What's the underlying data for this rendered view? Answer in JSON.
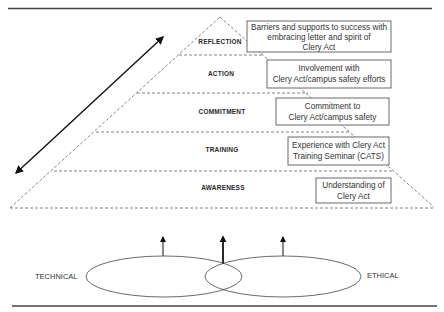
{
  "diagram": {
    "type": "pyramid-with-venn",
    "pyramid_layers": [
      {
        "label": "REFLECTION",
        "description": [
          "Barriers and supports to success with",
          "embracing letter and spirit of",
          "Clery Act"
        ]
      },
      {
        "label": "ACTION",
        "description": [
          "Involvement with",
          "Clery Act/campus safety efforts"
        ]
      },
      {
        "label": "COMMITMENT",
        "description": [
          "Commitment to",
          "Clery Act/campus safety"
        ]
      },
      {
        "label": "TRAINING",
        "description": [
          "Experience with Clery Act",
          "Training Seminar (CATS)"
        ]
      },
      {
        "label": "AWARENESS",
        "description": [
          "Understanding of",
          "Clery Act"
        ]
      }
    ],
    "venn": {
      "left_label": "TECHNICAL",
      "right_label": "ETHICAL"
    },
    "arrows": {
      "diagonal": "double-headed-arrow",
      "upward": [
        "technical-arrow",
        "intersection-arrow",
        "ethical-arrow"
      ]
    },
    "colors": {
      "line": "#333333",
      "dashed": "#666666",
      "background": "#ffffff"
    }
  }
}
